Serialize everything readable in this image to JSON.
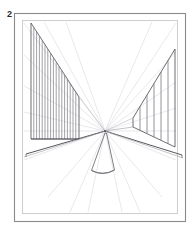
{
  "figure": {
    "label": "2",
    "type": "one-point-perspective-line-drawing",
    "caption_text": "",
    "background_color": "#ffffff"
  },
  "frames": {
    "outer": {
      "name": "outer-border",
      "x": 14,
      "y": 13,
      "width": 172,
      "height": 209,
      "stroke": "#8a8a8a",
      "stroke_width": 1.1
    },
    "inner": {
      "name": "inner-border",
      "x": 22,
      "y": 20,
      "width": 156,
      "height": 194,
      "stroke": "#c9c9c9",
      "stroke_width": 0.9
    }
  },
  "colors": {
    "dark_line": "#4d4d52",
    "medium_line": "#78787e",
    "light_line": "#b8b8c0",
    "faint_line": "#d8d8de",
    "frame_outer": "#8a8a8a",
    "frame_inner": "#c9c9c9",
    "label_text": "#2b2b2b"
  },
  "scene": {
    "vanishing_point": {
      "x": 105,
      "y": 131
    },
    "horizon_y": 131,
    "left_wall": {
      "name": "left-hatched-wall",
      "top_front_x": 31,
      "top_front_y": 23,
      "bottom_front_x": 31,
      "bottom_front_y": 139,
      "back_x": 79,
      "back_top_y": 97,
      "back_bottom_y": 139,
      "hatch_count": 17,
      "hatch_color": "#78787e"
    },
    "right_wall": {
      "name": "right-post-wall",
      "top_back_x": 133,
      "top_back_y": 118,
      "top_front_x": 175,
      "top_front_y": 49,
      "bottom_y_front": 150,
      "bottom_y_back": 127,
      "post_count": 6,
      "post_color": "#78787e"
    },
    "floor": {
      "name": "floor-plane",
      "left_edge_x": 26,
      "left_edge_y": 154,
      "right_edge_x": 182,
      "right_edge_y": 155
    },
    "cone": {
      "name": "center-cone-object",
      "apex_x": 105,
      "apex_y": 133,
      "base_center_x": 103,
      "base_y": 174,
      "base_half_width": 12
    },
    "radial_lines": {
      "name": "perspective-construction-rays",
      "count": 14,
      "color": "#d8d8de"
    }
  }
}
